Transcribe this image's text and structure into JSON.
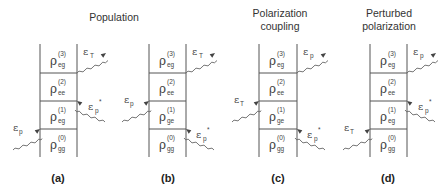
{
  "titles": {
    "population": "Population",
    "polarization_coupling_1": "Polarization",
    "polarization_coupling_2": "coupling",
    "perturbed_1": "Perturbed",
    "perturbed_2": "polarization"
  },
  "panels": [
    {
      "label": "(a)",
      "group_title": "Population",
      "rows": [
        {
          "symbol": "ρ",
          "sup": "(3)",
          "sub": "eg"
        },
        {
          "symbol": "ρ",
          "sup": "(2)",
          "sub": "ee"
        },
        {
          "symbol": "ρ",
          "sup": "(1)",
          "sub": "eg"
        },
        {
          "symbol": "ρ",
          "sup": "(0)",
          "sub": "gg"
        }
      ],
      "fields": [
        {
          "symbol": "ε",
          "sub": "p",
          "sup": "",
          "side": "left",
          "level": 1,
          "direction": "in"
        },
        {
          "symbol": "ε",
          "sub": "p",
          "sup": "*",
          "side": "right",
          "level": 2,
          "direction": "in"
        },
        {
          "symbol": "ε",
          "sub": "T",
          "sup": "",
          "side": "right",
          "level": 3,
          "direction": "out"
        }
      ]
    },
    {
      "label": "(b)",
      "group_title": "Population",
      "rows": [
        {
          "symbol": "ρ",
          "sup": "(3)",
          "sub": "eg"
        },
        {
          "symbol": "ρ",
          "sup": "(2)",
          "sub": "ee"
        },
        {
          "symbol": "ρ",
          "sup": "(1)",
          "sub": "ge"
        },
        {
          "symbol": "ρ",
          "sup": "(0)",
          "sub": "gg"
        }
      ],
      "fields": [
        {
          "symbol": "ε",
          "sub": "p",
          "sup": "*",
          "side": "right",
          "level": 1,
          "direction": "in"
        },
        {
          "symbol": "ε",
          "sub": "p",
          "sup": "",
          "side": "left",
          "level": 2,
          "direction": "in"
        },
        {
          "symbol": "ε",
          "sub": "T",
          "sup": "",
          "side": "right",
          "level": 3,
          "direction": "out"
        }
      ]
    },
    {
      "label": "(c)",
      "group_title": "Polarization coupling",
      "rows": [
        {
          "symbol": "ρ",
          "sup": "(3)",
          "sub": "eg"
        },
        {
          "symbol": "ρ",
          "sup": "(2)",
          "sub": "ee"
        },
        {
          "symbol": "ρ",
          "sup": "(1)",
          "sub": "ge"
        },
        {
          "symbol": "ρ",
          "sup": "(0)",
          "sub": "gg"
        }
      ],
      "fields": [
        {
          "symbol": "ε",
          "sub": "p",
          "sup": "*",
          "side": "right",
          "level": 1,
          "direction": "in"
        },
        {
          "symbol": "ε",
          "sub": "T",
          "sup": "",
          "side": "left",
          "level": 2,
          "direction": "in"
        },
        {
          "symbol": "ε",
          "sub": "p",
          "sup": "",
          "side": "right",
          "level": 3,
          "direction": "out"
        }
      ]
    },
    {
      "label": "(d)",
      "group_title": "Perturbed polarization",
      "rows": [
        {
          "symbol": "ρ",
          "sup": "(3)",
          "sub": "eg"
        },
        {
          "symbol": "ρ",
          "sup": "(2)",
          "sub": "ee"
        },
        {
          "symbol": "ρ",
          "sup": "(1)",
          "sub": "eg"
        },
        {
          "symbol": "ρ",
          "sup": "(0)",
          "sub": "gg"
        }
      ],
      "fields": [
        {
          "symbol": "ε",
          "sub": "T",
          "sup": "",
          "side": "left",
          "level": 1,
          "direction": "in"
        },
        {
          "symbol": "ε",
          "sub": "p",
          "sup": "*",
          "side": "right",
          "level": 2,
          "direction": "in"
        },
        {
          "symbol": "ε",
          "sub": "p",
          "sup": "",
          "side": "right",
          "level": 3,
          "direction": "out"
        }
      ]
    }
  ]
}
